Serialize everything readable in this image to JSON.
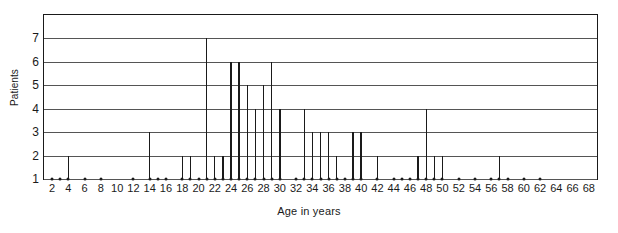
{
  "chart_data": {
    "type": "bar",
    "title": "",
    "xlabel": "Age in years",
    "ylabel": "Patients",
    "xlim": [
      1,
      69
    ],
    "ylim": [
      1,
      8
    ],
    "grid": true,
    "legend": null,
    "x_ticks": [
      2,
      4,
      6,
      8,
      10,
      12,
      14,
      16,
      18,
      20,
      22,
      24,
      26,
      28,
      30,
      32,
      34,
      36,
      38,
      40,
      42,
      44,
      46,
      48,
      50,
      52,
      54,
      56,
      58,
      60,
      62,
      64,
      66,
      68
    ],
    "y_ticks": [
      1,
      2,
      3,
      4,
      5,
      6,
      7
    ],
    "x": [
      2,
      3,
      4,
      6,
      8,
      12,
      14,
      15,
      16,
      18,
      19,
      20,
      21,
      22,
      23,
      24,
      25,
      26,
      27,
      28,
      29,
      30,
      32,
      33,
      34,
      35,
      36,
      37,
      38,
      39,
      40,
      42,
      44,
      45,
      46,
      47,
      48,
      49,
      50,
      52,
      54,
      56,
      57,
      58,
      60,
      62
    ],
    "values": [
      1,
      1,
      2,
      1,
      1,
      1,
      3,
      1,
      1,
      2,
      2,
      1,
      7,
      2,
      2,
      6,
      6,
      5,
      4,
      5,
      6,
      4,
      1,
      4,
      3,
      3,
      3,
      2,
      1,
      3,
      3,
      2,
      1,
      1,
      1,
      2,
      4,
      2,
      2,
      1,
      1,
      1,
      2,
      1,
      1,
      1
    ],
    "categories": [
      "2",
      "3",
      "4",
      "6",
      "8",
      "12",
      "14",
      "15",
      "16",
      "18",
      "19",
      "20",
      "21",
      "22",
      "23",
      "24",
      "25",
      "26",
      "27",
      "28",
      "29",
      "30",
      "32",
      "33",
      "34",
      "35",
      "36",
      "37",
      "38",
      "39",
      "40",
      "42",
      "44",
      "45",
      "46",
      "47",
      "48",
      "49",
      "50",
      "52",
      "54",
      "56",
      "57",
      "58",
      "60",
      "62"
    ]
  }
}
